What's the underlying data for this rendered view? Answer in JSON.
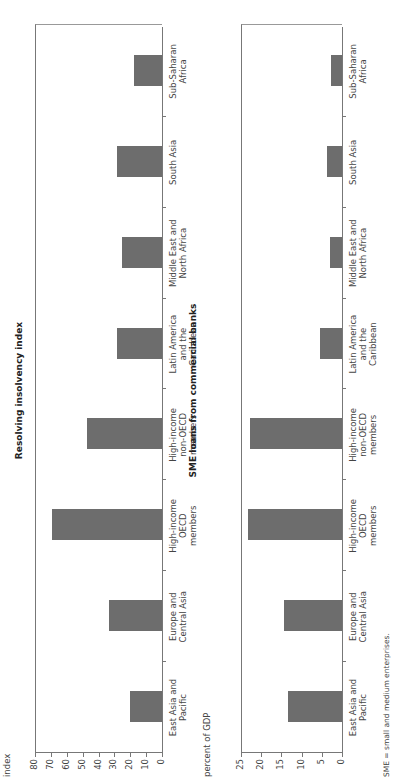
{
  "chart_data": [
    {
      "type": "bar",
      "title": "Resolving insolvency index",
      "xlabel": "",
      "ylabel": "index",
      "ylim": [
        0,
        80
      ],
      "yticks": [
        0,
        10,
        20,
        30,
        40,
        50,
        60,
        70,
        80
      ],
      "categories": [
        "East Asia and Pacific",
        "Europe and Central Asia",
        "High-income OECD members",
        "High-income non-OECD members",
        "Latin America and the Caribbean",
        "Middle East and North Africa",
        "South Asia",
        "Sub-Saharan Africa"
      ],
      "values": [
        21,
        34,
        70,
        48,
        29,
        26,
        29,
        18
      ],
      "grid": false,
      "legend": null,
      "orientation": "vertical bars, figure rotated 90 degrees counter-clockwise"
    },
    {
      "type": "bar",
      "title": "SME loans from commercial banks",
      "xlabel": "",
      "ylabel": "percent of GDP",
      "ylim": [
        0,
        25
      ],
      "yticks": [
        0,
        5,
        10,
        15,
        20,
        25
      ],
      "categories": [
        "East Asia and Pacific",
        "Europe and Central Asia",
        "High-income OECD members",
        "High-income non-OECD members",
        "Latin America and the Caribbean",
        "Middle East and North Africa",
        "South Asia",
        "Sub-Saharan Africa"
      ],
      "values": [
        13.5,
        14.5,
        23.5,
        23,
        5.8,
        3.3,
        4,
        3
      ],
      "grid": false,
      "legend": null,
      "orientation": "vertical bars, figure rotated 90 degrees counter-clockwise"
    }
  ],
  "panels": [
    {
      "title": "Resolving insolvency index",
      "unit": "index",
      "max": 80,
      "ticks": [
        "80",
        "70",
        "60",
        "50",
        "40",
        "30",
        "20",
        "10",
        "0"
      ]
    },
    {
      "title": "SME loans from commercial banks",
      "unit": "percent of GDP",
      "max": 25,
      "ticks": [
        "25",
        "20",
        "15",
        "10",
        "5",
        "0"
      ]
    }
  ],
  "category_labels": [
    "East Asia and\nPacific",
    "Europe and\nCentral Asia",
    "High-income\nOECD\nmembers",
    "High-income\nnon-OECD\nmembers",
    "Latin America\nand the\nCaribbean",
    "Middle East and\nNorth Africa",
    "South Asia",
    "Sub-Saharan\nAfrica"
  ],
  "footnote": "SME = small and medium enterprises.",
  "colors": {
    "bar": "#6d6d6d",
    "axis": "#777777"
  }
}
